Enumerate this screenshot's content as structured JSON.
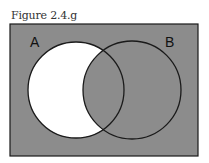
{
  "caption": "Figure 2.4.g",
  "diagram": {
    "type": "venn",
    "sets": [
      {
        "label": "A"
      },
      {
        "label": "B"
      }
    ],
    "shaded_regions": [
      "complement of A",
      "A ∩ B",
      "B only"
    ],
    "unshaded_regions": [
      "A only (A − B)"
    ],
    "colors": {
      "shaded": "#8c8c8c",
      "unshaded": "#ffffff",
      "stroke": "#1a1a1a"
    }
  }
}
